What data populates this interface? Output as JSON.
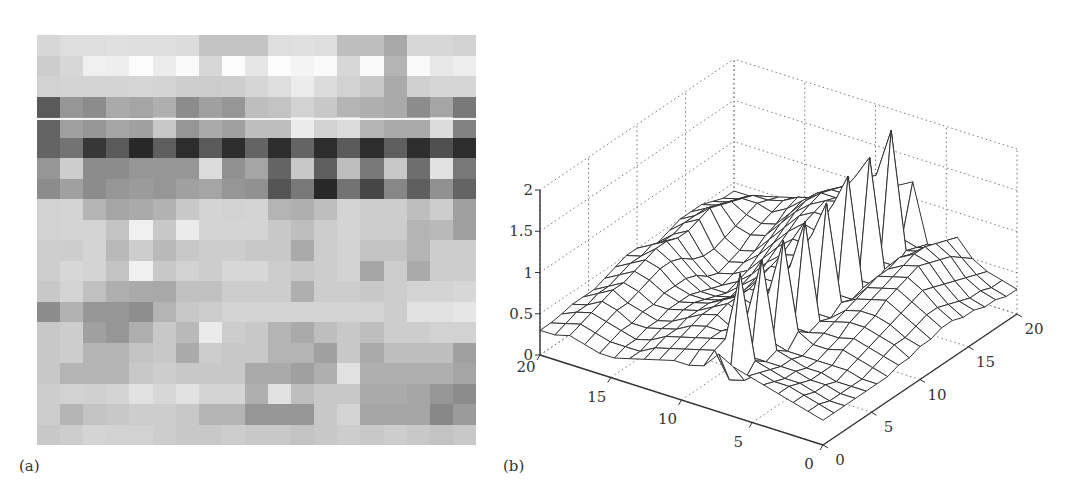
{
  "panel_labels": {
    "a": "(a)",
    "b": "(b)"
  },
  "colors": {
    "mesh_stroke": "#333333",
    "grid_dotted": "#777777",
    "axis": "#333333",
    "scanline": "#f4f4f4"
  },
  "chart_data": [
    {
      "type": "heatmap",
      "title": "",
      "panel": "(a)",
      "rows": 20,
      "cols": 19,
      "colormap": "gray",
      "scanline_row_fraction": 0.203,
      "values": [
        [
          215,
          222,
          222,
          224,
          222,
          222,
          220,
          196,
          196,
          196,
          222,
          224,
          222,
          190,
          190,
          168,
          215,
          215,
          210
        ],
        [
          205,
          215,
          240,
          238,
          252,
          236,
          250,
          215,
          252,
          230,
          252,
          244,
          250,
          215,
          250,
          180,
          250,
          232,
          238
        ],
        [
          210,
          212,
          212,
          212,
          214,
          212,
          206,
          204,
          206,
          214,
          222,
          236,
          220,
          210,
          200,
          170,
          208,
          214,
          214
        ],
        [
          90,
          150,
          140,
          170,
          165,
          175,
          140,
          160,
          150,
          190,
          195,
          210,
          200,
          180,
          175,
          170,
          140,
          165,
          120
        ],
        [
          100,
          160,
          150,
          165,
          160,
          200,
          150,
          170,
          160,
          190,
          190,
          235,
          210,
          220,
          180,
          170,
          170,
          220,
          130
        ],
        [
          100,
          115,
          55,
          90,
          40,
          95,
          45,
          90,
          45,
          100,
          45,
          100,
          45,
          90,
          45,
          95,
          45,
          80,
          45
        ],
        [
          150,
          205,
          140,
          140,
          150,
          150,
          150,
          220,
          145,
          165,
          100,
          200,
          95,
          190,
          120,
          200,
          110,
          225,
          120
        ],
        [
          140,
          160,
          140,
          150,
          155,
          150,
          160,
          165,
          150,
          145,
          85,
          120,
          40,
          115,
          70,
          135,
          95,
          145,
          100
        ],
        [
          210,
          212,
          180,
          165,
          170,
          178,
          200,
          212,
          210,
          212,
          180,
          175,
          190,
          212,
          205,
          205,
          190,
          205,
          160
        ],
        [
          210,
          212,
          212,
          195,
          240,
          200,
          235,
          212,
          212,
          212,
          200,
          190,
          205,
          212,
          205,
          205,
          180,
          185,
          160
        ],
        [
          206,
          205,
          212,
          185,
          205,
          185,
          200,
          205,
          205,
          200,
          200,
          170,
          205,
          210,
          195,
          195,
          180,
          205,
          205
        ],
        [
          206,
          215,
          212,
          195,
          240,
          200,
          210,
          205,
          215,
          215,
          205,
          200,
          205,
          210,
          165,
          205,
          170,
          205,
          205
        ],
        [
          200,
          212,
          192,
          175,
          170,
          168,
          192,
          192,
          205,
          205,
          205,
          175,
          205,
          205,
          200,
          205,
          212,
          212,
          215
        ],
        [
          140,
          178,
          150,
          150,
          142,
          180,
          200,
          205,
          212,
          212,
          212,
          212,
          212,
          212,
          212,
          205,
          225,
          225,
          230
        ],
        [
          200,
          205,
          160,
          150,
          175,
          200,
          185,
          235,
          205,
          200,
          180,
          170,
          190,
          200,
          190,
          205,
          205,
          210,
          210
        ],
        [
          200,
          205,
          180,
          180,
          195,
          200,
          170,
          205,
          200,
          200,
          180,
          180,
          160,
          200,
          170,
          190,
          190,
          190,
          160
        ],
        [
          200,
          180,
          180,
          180,
          200,
          205,
          200,
          200,
          200,
          170,
          170,
          160,
          175,
          225,
          175,
          175,
          175,
          175,
          165
        ],
        [
          205,
          210,
          208,
          212,
          225,
          215,
          225,
          212,
          212,
          175,
          225,
          190,
          200,
          200,
          170,
          170,
          165,
          150,
          140
        ],
        [
          205,
          180,
          195,
          200,
          205,
          205,
          200,
          180,
          180,
          150,
          150,
          150,
          200,
          212,
          165,
          165,
          165,
          135,
          155
        ],
        [
          200,
          205,
          212,
          210,
          210,
          205,
          200,
          200,
          205,
          200,
          200,
          195,
          200,
          205,
          200,
          205,
          200,
          195,
          200
        ]
      ]
    },
    {
      "type": "surface",
      "title": "",
      "panel": "(b)",
      "xlabel": "",
      "ylabel": "",
      "zlabel": "",
      "x_ticks": [
        0,
        5,
        10,
        15,
        20
      ],
      "y_ticks": [
        0,
        5,
        10,
        15,
        20
      ],
      "z_ticks": [
        0,
        0.5,
        1,
        1.5,
        2
      ],
      "x_tick_labels": [
        "0",
        "5",
        "10",
        "15",
        "20"
      ],
      "y_tick_labels": [
        "0",
        "5",
        "10",
        "15",
        "20"
      ],
      "z_tick_labels": [
        "0",
        "0.5",
        "1",
        "1.5",
        "2"
      ],
      "xlim": [
        0,
        20
      ],
      "ylim": [
        0,
        20
      ],
      "zlim": [
        0,
        2
      ],
      "grid": true,
      "style": "wireframe mesh, 20x19 grid; broad plateau ~0.8-1.3 with crest ~1.75 near back; row of sharp spikes up to ~2.0 around x=12-14; low ~0.3 regions near front",
      "z": [
        [
          0.3,
          0.3,
          0.32,
          0.35,
          0.35,
          0.35,
          0.4,
          0.45,
          0.5,
          0.5,
          0.4,
          0.4,
          0.45,
          0.5,
          0.5,
          0.5,
          0.45,
          0.4,
          0.4
        ],
        [
          0.3,
          0.35,
          0.4,
          0.4,
          0.45,
          0.45,
          0.5,
          0.55,
          0.55,
          0.6,
          0.55,
          0.55,
          0.6,
          0.6,
          0.6,
          0.55,
          0.5,
          0.45,
          0.4
        ],
        [
          0.35,
          0.4,
          0.45,
          0.5,
          0.55,
          0.55,
          0.6,
          0.65,
          0.7,
          0.7,
          0.65,
          0.65,
          0.7,
          0.75,
          0.7,
          0.65,
          0.6,
          0.55,
          0.45
        ],
        [
          0.3,
          0.35,
          0.4,
          0.45,
          0.45,
          0.5,
          0.55,
          0.6,
          0.6,
          0.55,
          0.45,
          0.4,
          0.4,
          0.45,
          0.5,
          0.55,
          0.6,
          0.55,
          0.5
        ],
        [
          0.25,
          0.3,
          0.35,
          0.35,
          0.4,
          0.4,
          0.45,
          0.45,
          0.45,
          0.4,
          0.3,
          0.25,
          0.3,
          0.35,
          0.45,
          0.5,
          0.55,
          0.6,
          0.55
        ],
        [
          0.25,
          0.3,
          0.3,
          0.35,
          0.35,
          0.4,
          0.4,
          0.4,
          0.35,
          0.3,
          0.25,
          0.3,
          0.35,
          0.4,
          0.5,
          0.55,
          0.65,
          0.7,
          0.6
        ],
        [
          0.3,
          0.3,
          0.35,
          0.4,
          0.4,
          0.45,
          0.45,
          0.4,
          0.35,
          0.3,
          0.35,
          0.4,
          0.5,
          0.6,
          0.7,
          0.75,
          0.8,
          0.75,
          0.65
        ],
        [
          0.35,
          0.4,
          0.45,
          0.45,
          0.5,
          0.5,
          0.5,
          0.45,
          0.4,
          0.45,
          0.5,
          0.6,
          0.7,
          0.8,
          0.9,
          0.95,
          0.95,
          0.9,
          0.8
        ],
        [
          0.4,
          0.45,
          0.5,
          0.55,
          0.6,
          0.6,
          0.6,
          0.55,
          0.55,
          0.6,
          0.7,
          0.8,
          0.9,
          1.0,
          1.05,
          1.1,
          1.05,
          1.0,
          0.9
        ],
        [
          0.45,
          0.5,
          0.55,
          0.6,
          0.65,
          0.7,
          0.7,
          0.7,
          0.75,
          0.8,
          0.85,
          0.95,
          1.05,
          1.1,
          1.15,
          1.1,
          1.05,
          0.95,
          0.85
        ],
        [
          0.45,
          0.55,
          0.6,
          0.6,
          0.55,
          0.6,
          0.65,
          0.7,
          0.75,
          0.8,
          0.9,
          0.95,
          1.0,
          1.1,
          1.2,
          1.15,
          1.1,
          1.0,
          0.9
        ],
        [
          0.5,
          0.6,
          0.65,
          0.7,
          0.75,
          0.8,
          0.85,
          0.9,
          1.0,
          1.1,
          1.2,
          1.3,
          1.4,
          1.5,
          1.55,
          1.45,
          1.4,
          1.2,
          1.1
        ],
        [
          0.7,
          0.3,
          1.5,
          0.4,
          1.5,
          0.4,
          1.55,
          0.4,
          1.6,
          0.4,
          1.65,
          0.45,
          1.8,
          0.45,
          1.85,
          0.5,
          2.0,
          0.6,
          1.2
        ],
        [
          0.6,
          0.35,
          0.5,
          0.4,
          0.45,
          0.35,
          0.5,
          0.4,
          0.45,
          0.4,
          0.5,
          0.45,
          0.5,
          0.45,
          0.55,
          0.5,
          0.6,
          0.55,
          0.5
        ],
        [
          0.55,
          0.5,
          0.45,
          0.4,
          0.4,
          0.35,
          0.4,
          0.45,
          0.5,
          0.55,
          0.6,
          0.65,
          0.7,
          0.7,
          0.75,
          0.7,
          0.65,
          0.6,
          0.55
        ],
        [
          0.5,
          0.45,
          0.4,
          0.4,
          0.35,
          0.35,
          0.4,
          0.45,
          0.55,
          0.6,
          0.65,
          0.7,
          0.75,
          0.8,
          0.85,
          0.85,
          0.8,
          0.75,
          0.7
        ],
        [
          0.45,
          0.45,
          0.4,
          0.35,
          0.35,
          0.35,
          0.45,
          0.5,
          0.55,
          0.6,
          0.7,
          0.75,
          0.8,
          0.85,
          0.8,
          0.75,
          0.7,
          0.6,
          0.5
        ],
        [
          0.4,
          0.4,
          0.35,
          0.35,
          0.3,
          0.35,
          0.4,
          0.45,
          0.5,
          0.55,
          0.6,
          0.65,
          0.7,
          0.65,
          0.6,
          0.55,
          0.5,
          0.45,
          0.4
        ],
        [
          0.35,
          0.35,
          0.3,
          0.3,
          0.3,
          0.3,
          0.35,
          0.4,
          0.45,
          0.45,
          0.5,
          0.55,
          0.55,
          0.5,
          0.45,
          0.4,
          0.4,
          0.35,
          0.35
        ],
        [
          0.3,
          0.3,
          0.3,
          0.3,
          0.3,
          0.3,
          0.3,
          0.35,
          0.35,
          0.4,
          0.4,
          0.45,
          0.45,
          0.4,
          0.4,
          0.35,
          0.35,
          0.3,
          0.3
        ]
      ]
    }
  ]
}
